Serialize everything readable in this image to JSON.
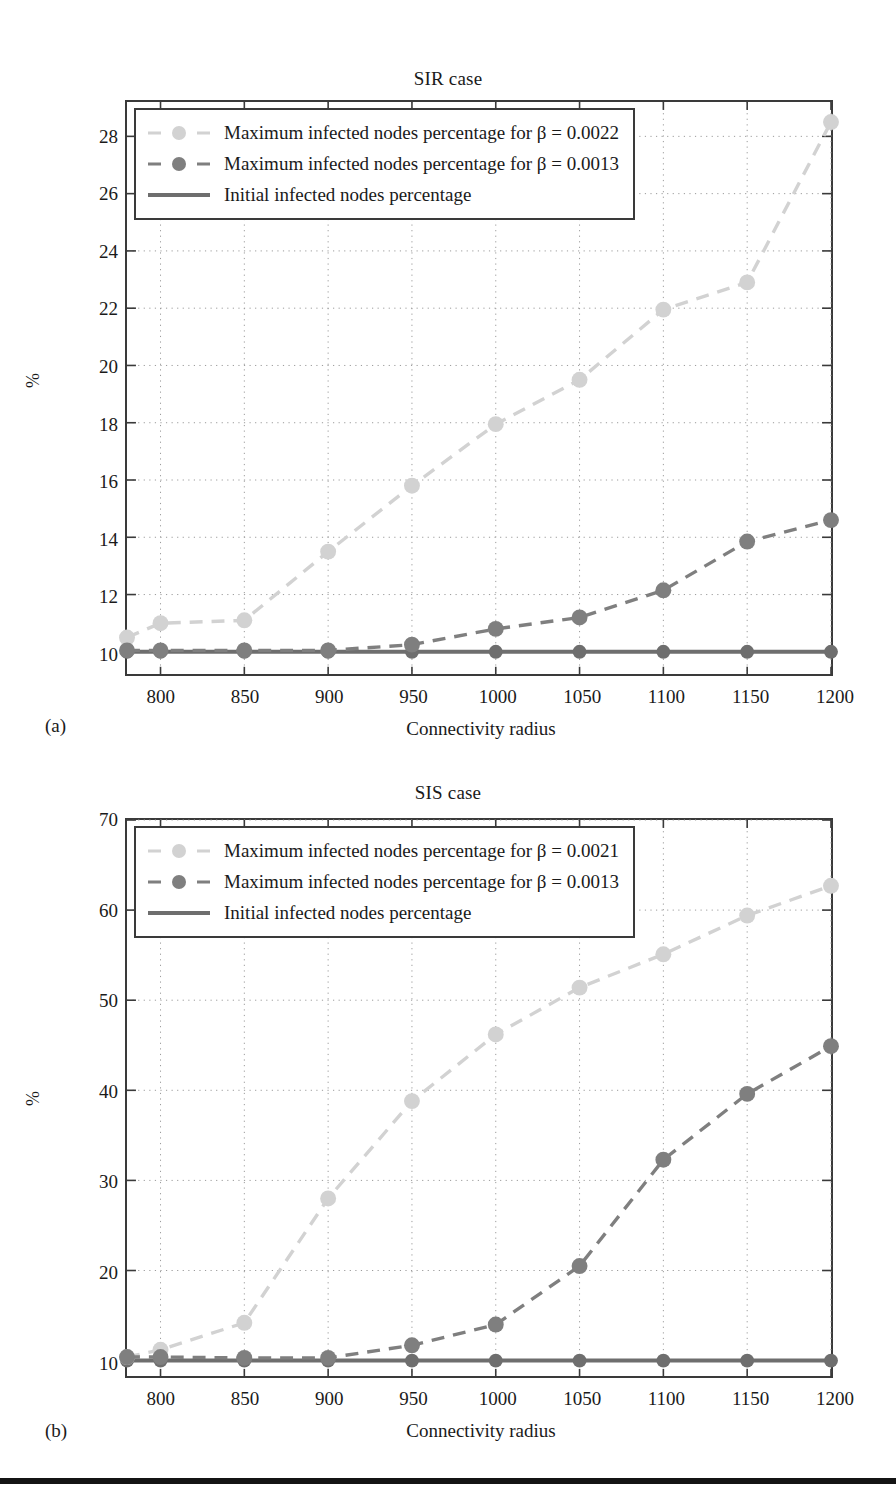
{
  "figure": {
    "bottom_rule_color": "#141414"
  },
  "colors": {
    "light_series": "#d2d2d2",
    "dark_series": "#7f7f7f",
    "baseline": "#6e6e6e",
    "axis": "#3a3a3a",
    "grid": "#9a9a9a"
  },
  "panels": [
    {
      "id": "a",
      "subplot_label": "(a)",
      "title": "SIR case",
      "xlabel": "Connectivity radius",
      "ylabel": "%",
      "legend": [
        {
          "label": "Maximum infected nodes percentage for β = 0.0022",
          "style": "dashed-marker",
          "color": "#d2d2d2"
        },
        {
          "label": "Maximum infected nodes percentage for β = 0.0013",
          "style": "dashed-marker",
          "color": "#7f7f7f"
        },
        {
          "label": "Initial infected nodes percentage",
          "style": "solid",
          "color": "#6e6e6e"
        }
      ],
      "chart_data": {
        "type": "line",
        "title": "SIR case",
        "xlabel": "Connectivity radius",
        "ylabel": "%",
        "xlim": [
          780,
          1200
        ],
        "ylim": [
          9.2,
          29.2
        ],
        "xticks": [
          800,
          850,
          900,
          950,
          1000,
          1050,
          1100,
          1150,
          1200
        ],
        "yticks": [
          10,
          12,
          14,
          16,
          18,
          20,
          22,
          24,
          26,
          28
        ],
        "grid": true,
        "legend_position": "upper-left",
        "x": [
          780,
          800,
          850,
          900,
          950,
          1000,
          1050,
          1100,
          1150,
          1200
        ],
        "series": [
          {
            "name": "Maximum infected nodes percentage for β = 0.0022",
            "color": "#d2d2d2",
            "values": [
              10.5,
              11.0,
              11.1,
              13.5,
              15.8,
              17.95,
              19.5,
              21.95,
              22.9,
              28.5
            ]
          },
          {
            "name": "Maximum infected nodes percentage for β = 0.0013",
            "color": "#7f7f7f",
            "values": [
              10.05,
              10.05,
              10.05,
              10.05,
              10.25,
              10.8,
              11.2,
              12.15,
              13.85,
              14.6
            ]
          },
          {
            "name": "Initial infected nodes percentage",
            "color": "#6e6e6e",
            "style": "solid",
            "values": [
              10.0,
              10.0,
              10.0,
              10.0,
              10.0,
              10.0,
              10.0,
              10.0,
              10.0,
              10.0
            ]
          }
        ]
      }
    },
    {
      "id": "b",
      "subplot_label": "(b)",
      "title": "SIS case",
      "xlabel": "Connectivity radius",
      "ylabel": "%",
      "legend": [
        {
          "label": "Maximum infected nodes percentage for β = 0.0021",
          "style": "dashed-marker",
          "color": "#d2d2d2"
        },
        {
          "label": "Maximum infected nodes percentage for β = 0.0013",
          "style": "dashed-marker",
          "color": "#7f7f7f"
        },
        {
          "label": "Initial infected nodes percentage",
          "style": "solid",
          "color": "#6e6e6e"
        }
      ],
      "chart_data": {
        "type": "line",
        "title": "SIS case",
        "xlabel": "Connectivity radius",
        "ylabel": "%",
        "xlim": [
          780,
          1200
        ],
        "ylim": [
          8.2,
          70.0
        ],
        "xticks": [
          800,
          850,
          900,
          950,
          1000,
          1050,
          1100,
          1150,
          1200
        ],
        "yticks": [
          10,
          20,
          30,
          40,
          50,
          60,
          70
        ],
        "grid": true,
        "legend_position": "upper-left",
        "x": [
          780,
          800,
          850,
          900,
          950,
          1000,
          1050,
          1100,
          1150,
          1200
        ],
        "series": [
          {
            "name": "Maximum infected nodes percentage for β = 0.0021",
            "color": "#d2d2d2",
            "values": [
              10.4,
              11.2,
              14.2,
              28.0,
              38.8,
              46.2,
              51.4,
              55.1,
              59.4,
              62.7
            ]
          },
          {
            "name": "Maximum infected nodes percentage for β = 0.0013",
            "color": "#7f7f7f",
            "values": [
              10.4,
              10.4,
              10.3,
              10.3,
              11.7,
              14.0,
              20.5,
              32.3,
              39.6,
              44.9
            ]
          },
          {
            "name": "Initial infected nodes percentage",
            "color": "#6e6e6e",
            "style": "solid",
            "values": [
              10.0,
              10.0,
              10.0,
              10.0,
              10.0,
              10.0,
              10.0,
              10.0,
              10.0,
              10.0
            ]
          }
        ]
      }
    }
  ]
}
